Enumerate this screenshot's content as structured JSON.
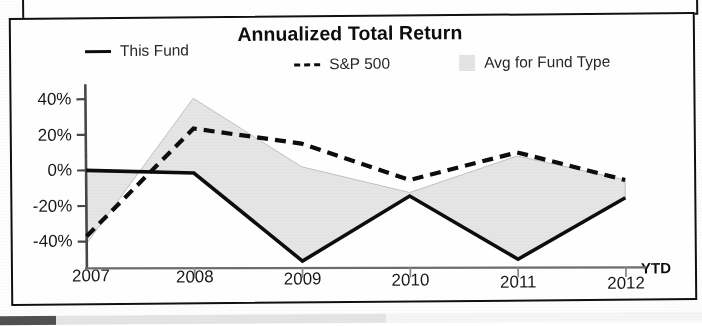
{
  "chart_data": {
    "type": "line",
    "title": "Annualized Total Return",
    "xlabel": "",
    "ylabel": "",
    "x_axis_note": "YTD",
    "categories": [
      "2007",
      "2008",
      "2009",
      "2010",
      "2011",
      "2012"
    ],
    "ylim": [
      -55,
      45
    ],
    "ytick_labels": [
      "40%",
      "20%",
      "0%",
      "-20%",
      "-40%"
    ],
    "ytick_values": [
      40,
      20,
      0,
      -20,
      -40
    ],
    "grid": false,
    "legend_position": "top",
    "series": [
      {
        "name": "This Fund",
        "style": "solid",
        "color": "#111111",
        "values": [
          0,
          -2,
          -52,
          -16,
          -52,
          -18
        ]
      },
      {
        "name": "S&P 500",
        "style": "dashed",
        "color": "#111111",
        "values": [
          -37,
          23,
          14,
          -7,
          8,
          -8
        ]
      },
      {
        "name": "Avg for Fund Type",
        "style": "filled-area",
        "color": "#dcdcdc",
        "values": [
          -41,
          40,
          1,
          -14,
          6,
          -8
        ]
      }
    ]
  },
  "chart": {
    "title": "Annualized Total Return",
    "ytd_suffix": "YTD",
    "legend": [
      {
        "label": "This Fund",
        "marker": "solid-line-icon"
      },
      {
        "label": "S&P 500",
        "marker": "dashed-line-icon"
      },
      {
        "label": "Avg for Fund Type",
        "marker": "area-swatch-icon"
      }
    ],
    "y_labels": [
      "40%",
      "20%",
      "0%",
      "-20%",
      "-40%"
    ],
    "x_labels": [
      "2007",
      "2008",
      "2009",
      "2010",
      "2011",
      "2012"
    ]
  },
  "colors": {
    "ink": "#111111",
    "band": "#dcdcdc",
    "paper": "#ffffff",
    "frame": "#141414"
  }
}
